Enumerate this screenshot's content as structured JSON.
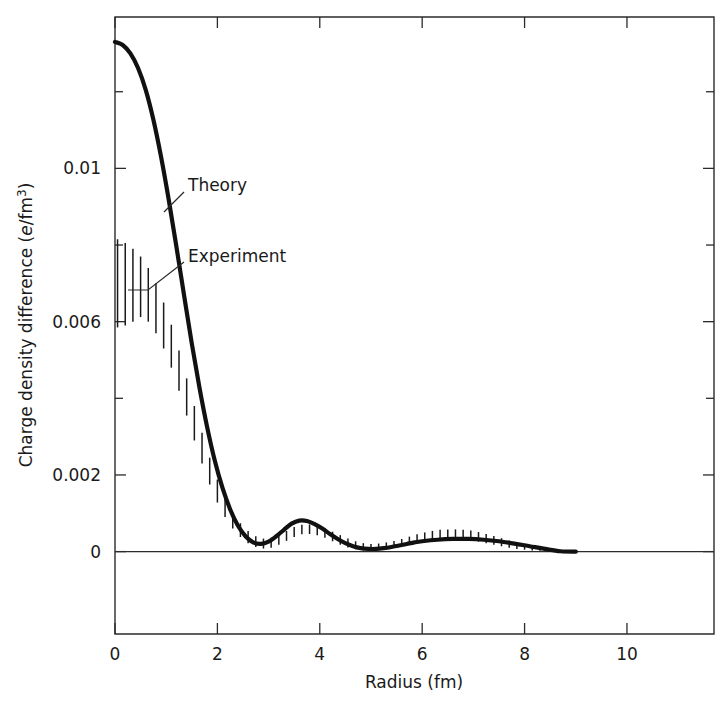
{
  "figure": {
    "background_color": "#ffffff",
    "ink_color": "#111111"
  },
  "annotations": {
    "theory_label": "Theory",
    "experiment_label": "Experiment"
  },
  "axes": {
    "x_title": "Radius (fm)",
    "y_title_prefix": "Charge density difference (",
    "y_title_italic": "e",
    "y_title_mid": "/fm",
    "y_title_exponent": "3",
    "y_title_suffix": ")",
    "x_ticks": [
      "0",
      "2",
      "4",
      "6",
      "8",
      "10"
    ],
    "y_ticks": [
      "0",
      "0.002",
      "0.006",
      "0.01"
    ]
  },
  "chart_data": {
    "type": "line",
    "title": "",
    "subtitle": "",
    "xlabel": "Radius (fm)",
    "ylabel": "Charge density difference (e/fm^3)",
    "xlim": [
      0,
      11.7
    ],
    "ylim": [
      -0.00215,
      0.01395
    ],
    "grid": false,
    "legend_position": "inline-annotation",
    "x_tick_values": [
      0,
      2,
      4,
      6,
      8,
      10
    ],
    "y_tick_values": [
      0,
      0.002,
      0.006,
      0.01
    ],
    "y_minor_tick_values": [
      0.004,
      0.008,
      0.012
    ],
    "zero_reference_line": 0,
    "series": [
      {
        "name": "Theory",
        "style": "solid-thick-line",
        "x": [
          0.0,
          0.15,
          0.3,
          0.45,
          0.6,
          0.75,
          0.9,
          1.05,
          1.2,
          1.35,
          1.5,
          1.65,
          1.8,
          1.95,
          2.1,
          2.25,
          2.4,
          2.55,
          2.7,
          2.85,
          3.0,
          3.15,
          3.3,
          3.45,
          3.6,
          3.75,
          3.9,
          4.05,
          4.2,
          4.35,
          4.5,
          4.65,
          4.8,
          4.95,
          5.1,
          5.25,
          5.4,
          5.55,
          5.7,
          5.85,
          6.0,
          6.3,
          6.6,
          6.9,
          7.2,
          7.5,
          7.8,
          8.1,
          8.4,
          8.7,
          9.0
        ],
        "y": [
          0.0133,
          0.01322,
          0.013,
          0.01262,
          0.01205,
          0.01127,
          0.0103,
          0.00918,
          0.00795,
          0.00668,
          0.00543,
          0.00428,
          0.00325,
          0.00237,
          0.00166,
          0.0011,
          0.00068,
          0.0004,
          0.00024,
          0.0002,
          0.00026,
          0.0004,
          0.00057,
          0.00073,
          0.00081,
          0.0008,
          0.00072,
          0.0006,
          0.00046,
          0.00033,
          0.00022,
          0.00014,
          9e-05,
          7e-05,
          7e-05,
          9e-05,
          0.00012,
          0.00016,
          0.0002,
          0.00024,
          0.00027,
          0.00031,
          0.00033,
          0.00033,
          0.00031,
          0.00027,
          0.00021,
          0.00014,
          7e-05,
          1e-05,
          0.0
        ]
      },
      {
        "name": "Experiment",
        "style": "vertical-error-bars",
        "x": [
          0.05,
          0.2,
          0.35,
          0.5,
          0.65,
          0.8,
          0.95,
          1.1,
          1.25,
          1.4,
          1.55,
          1.7,
          1.85,
          2.0,
          2.15,
          2.3,
          2.45,
          2.6,
          2.75,
          2.9,
          3.05,
          3.2,
          3.35,
          3.5,
          3.65,
          3.8,
          3.95,
          4.1,
          4.25,
          4.4,
          4.55,
          4.7,
          4.85,
          5.0,
          5.15,
          5.3,
          5.45,
          5.6,
          5.75,
          5.9,
          6.05,
          6.2,
          6.35,
          6.5,
          6.65,
          6.8,
          6.95,
          7.1,
          7.25,
          7.4,
          7.55,
          7.7,
          7.85,
          8.0,
          8.15,
          8.3,
          8.45,
          8.6
        ],
        "y_low": [
          0.00585,
          0.0059,
          0.006,
          0.00612,
          0.006,
          0.0057,
          0.0053,
          0.0048,
          0.0042,
          0.00355,
          0.0029,
          0.0023,
          0.00175,
          0.00128,
          0.0009,
          0.0006,
          0.00038,
          0.00022,
          0.00012,
          8e-05,
          0.0001,
          0.00018,
          0.00028,
          0.00038,
          0.00045,
          0.00046,
          0.00043,
          0.00036,
          0.00027,
          0.00018,
          0.00011,
          6e-05,
          3e-05,
          3e-05,
          4e-05,
          7e-05,
          0.0001,
          0.00014,
          0.00018,
          0.00022,
          0.00026,
          0.00029,
          0.00031,
          0.00032,
          0.00032,
          0.00031,
          0.00029,
          0.00026,
          0.00022,
          0.00018,
          0.00014,
          0.0001,
          7e-05,
          5e-05,
          3e-05,
          2e-05,
          1e-05,
          0.0
        ],
        "y_high": [
          0.00815,
          0.00805,
          0.0079,
          0.0077,
          0.0074,
          0.007,
          0.0065,
          0.00592,
          0.00525,
          0.00452,
          0.0038,
          0.0031,
          0.00245,
          0.00188,
          0.0014,
          0.00102,
          0.00074,
          0.00054,
          0.0004,
          0.00034,
          0.00036,
          0.00044,
          0.00054,
          0.00064,
          0.0007,
          0.00071,
          0.00068,
          0.00061,
          0.00052,
          0.00043,
          0.00034,
          0.00027,
          0.00022,
          0.0002,
          0.00021,
          0.00024,
          0.00028,
          0.00033,
          0.00039,
          0.00045,
          0.0005,
          0.00054,
          0.00057,
          0.00058,
          0.00058,
          0.00057,
          0.00055,
          0.00051,
          0.00046,
          0.00041,
          0.00035,
          0.00029,
          0.00023,
          0.00017,
          0.00012,
          8e-05,
          4e-05,
          1e-05
        ]
      }
    ]
  }
}
